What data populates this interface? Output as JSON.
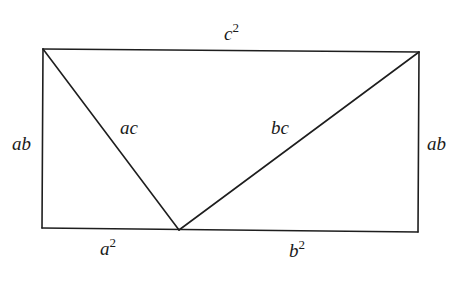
{
  "diagram": {
    "type": "geometric-proof-figure",
    "stroke_color": "#1e1e1e",
    "background": "#ffffff",
    "vertices": {
      "top_left": [
        43,
        49
      ],
      "top_right": [
        419,
        52
      ],
      "bottom_left": [
        42,
        228
      ],
      "bottom_right": [
        418,
        232
      ],
      "bottom_apex": [
        179,
        230
      ]
    },
    "labels": {
      "top": {
        "base": "c",
        "exp": "2"
      },
      "left": {
        "base": "ab"
      },
      "right": {
        "base": "ab"
      },
      "left_diagonal": {
        "base": "ac"
      },
      "right_diagonal": {
        "base": "bc"
      },
      "bottom_left": {
        "base": "a",
        "exp": "2"
      },
      "bottom_right": {
        "base": "b",
        "exp": "2"
      }
    }
  }
}
